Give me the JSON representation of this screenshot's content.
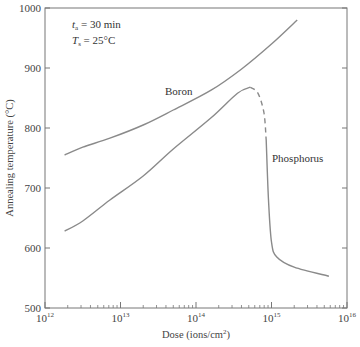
{
  "chart_data": {
    "type": "line",
    "title": "",
    "xlabel": "Dose (ions/cm²)",
    "ylabel": "Annealing temperature (°C)",
    "xscale": "log",
    "xlim": [
      1000000000000.0,
      1e+16
    ],
    "ylim": [
      500,
      1000
    ],
    "x_ticks": [
      {
        "exp": "12",
        "base": "10"
      },
      {
        "exp": "13",
        "base": "10"
      },
      {
        "exp": "14",
        "base": "10"
      },
      {
        "exp": "15",
        "base": "10"
      },
      {
        "exp": "16",
        "base": "10"
      }
    ],
    "y_ticks": [
      "500",
      "600",
      "700",
      "800",
      "900",
      "1000"
    ],
    "grid": false,
    "annotations": [
      {
        "var": "t",
        "sub": "a",
        "text": " = 30 min"
      },
      {
        "var": "T",
        "sub": "s",
        "text": " = 25°C"
      }
    ],
    "series": [
      {
        "name": "Boron",
        "points": [
          {
            "log_dose": 12.26,
            "temp": 755
          },
          {
            "log_dose": 12.5,
            "temp": 768
          },
          {
            "log_dose": 12.86,
            "temp": 783
          },
          {
            "log_dose": 13.3,
            "temp": 805
          },
          {
            "log_dose": 13.7,
            "temp": 830
          },
          {
            "log_dose": 14.2,
            "temp": 863
          },
          {
            "log_dose": 14.6,
            "temp": 898
          },
          {
            "log_dose": 15.0,
            "temp": 940
          },
          {
            "log_dose": 15.34,
            "temp": 980
          }
        ]
      },
      {
        "name": "Phosphorus",
        "points": [
          {
            "log_dose": 12.26,
            "temp": 628
          },
          {
            "log_dose": 12.5,
            "temp": 645
          },
          {
            "log_dose": 12.86,
            "temp": 680
          },
          {
            "log_dose": 13.3,
            "temp": 720
          },
          {
            "log_dose": 13.7,
            "temp": 765
          },
          {
            "log_dose": 14.2,
            "temp": 817
          },
          {
            "log_dose": 14.55,
            "temp": 858
          },
          {
            "log_dose": 14.72,
            "temp": 868
          }
        ],
        "dashed_points": [
          {
            "log_dose": 14.72,
            "temp": 868
          },
          {
            "log_dose": 14.82,
            "temp": 858
          },
          {
            "log_dose": 14.9,
            "temp": 825
          },
          {
            "log_dose": 14.93,
            "temp": 780
          }
        ],
        "tail_points": [
          {
            "log_dose": 14.93,
            "temp": 780
          },
          {
            "log_dose": 14.96,
            "temp": 680
          },
          {
            "log_dose": 15.0,
            "temp": 610
          },
          {
            "log_dose": 15.07,
            "temp": 585
          },
          {
            "log_dose": 15.3,
            "temp": 568
          },
          {
            "log_dose": 15.76,
            "temp": 553
          }
        ]
      }
    ],
    "labels": {
      "boron": "Boron",
      "phosphorus": "Phosphorus"
    }
  }
}
